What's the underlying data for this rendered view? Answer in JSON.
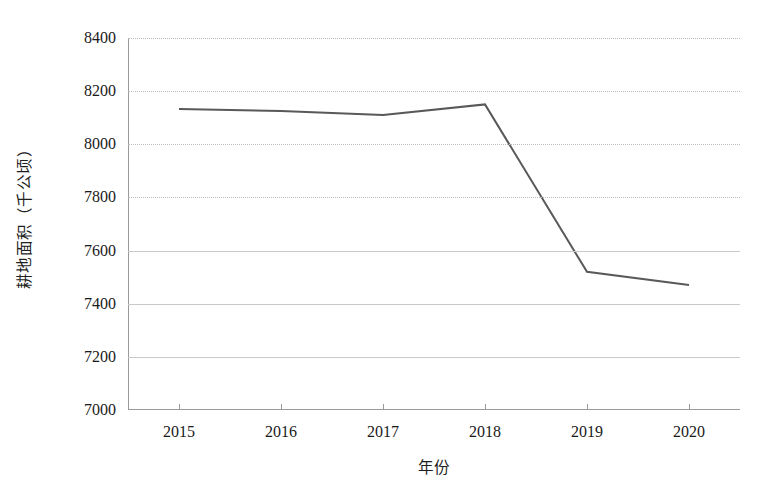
{
  "chart_data": {
    "type": "line",
    "title": "",
    "subtitle": "",
    "xlabel": "年份",
    "ylabel": "耕地面积（千公顷）",
    "categories": [
      "2015",
      "2016",
      "2017",
      "2018",
      "2019",
      "2020"
    ],
    "x": [
      2015,
      2016,
      2017,
      2018,
      2019,
      2020
    ],
    "values": [
      8133,
      8125,
      8110,
      8150,
      7520,
      7470
    ],
    "series": [
      {
        "name": "耕地面积",
        "values": [
          8133,
          8125,
          8110,
          8150,
          7520,
          7470
        ],
        "color": "#595959"
      }
    ],
    "ylim": [
      7000,
      8400
    ],
    "yticks": [
      7000,
      7200,
      7400,
      7600,
      7800,
      8000,
      8200,
      8400
    ],
    "ytick_labels": [
      "7000",
      "7200",
      "7400",
      "7600",
      "7800",
      "8000",
      "8200",
      "8400"
    ],
    "xtick_labels": [
      "2015",
      "2016",
      "2017",
      "2018",
      "2019",
      "2020"
    ],
    "grid": true,
    "grid_axis": "y",
    "legend": false,
    "legend_position": "none",
    "markers": false,
    "line_width": 2,
    "annotations": []
  },
  "style": {
    "background": "#ffffff",
    "line_color": "#595959",
    "grid_color": "#c9c9c9",
    "axis_color": "#9a9a9a",
    "text_color": "#1a1a1a"
  }
}
